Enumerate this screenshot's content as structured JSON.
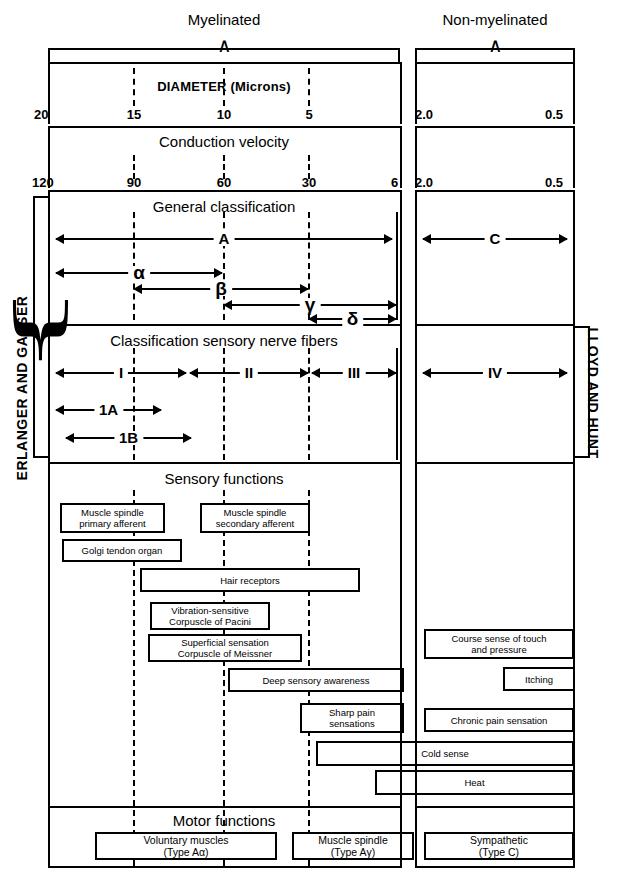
{
  "top_brackets": [
    {
      "label": "Myelinated"
    },
    {
      "label": "Non-myelinated"
    }
  ],
  "axes": {
    "diameter_title": "DIAMETER (Microns)",
    "velocity_title": "Conduction velocity",
    "diameter_ticks_left": [
      "20",
      "15",
      "10",
      "5"
    ],
    "diameter_ticks_right": [
      "2.0",
      "0.5"
    ],
    "velocity_ticks_left": [
      "120",
      "90",
      "60",
      "30",
      "6"
    ],
    "velocity_ticks_right": [
      "2.0",
      "0.5"
    ]
  },
  "side_labels": {
    "left": "ERLANGER AND GASSER",
    "right": "LLOYD AND HUNT"
  },
  "sections": {
    "general": {
      "title": "General classification",
      "spans_left": [
        "A",
        "α",
        "β",
        "γ",
        "δ"
      ],
      "spans_right": [
        "C"
      ]
    },
    "sensory_classification": {
      "title": "Classification sensory nerve fibers",
      "spans_left": [
        "I",
        "II",
        "III",
        "1A",
        "1B"
      ],
      "spans_right": [
        "IV"
      ]
    },
    "sensory_functions": {
      "title": "Sensory functions",
      "boxes_left": [
        "Muscle spindle\nprimary afferent",
        "Muscle spindle\nsecondary afferent",
        "Golgi tendon organ",
        "Hair receptors",
        "Vibration-sensitive\nCorpuscle of Pacini",
        "Superficial sensation\nCorpuscle of Meissner",
        "Deep sensory awareness",
        "Sharp pain\nsensations"
      ],
      "boxes_right": [
        "Course sense of touch\nand pressure",
        "Itching",
        "Chronic pain sensation"
      ],
      "boxes_spanning": [
        "Cold sense",
        "Heat"
      ]
    },
    "motor_functions": {
      "title": "Motor functions",
      "boxes": [
        "Voluntary muscles\n(Type Aα)",
        "Muscle spindle\n(Type Aγ)",
        "Sympathetic\n(Type C)"
      ]
    }
  },
  "colors": {
    "ink": "#000000",
    "paper": "#ffffff"
  }
}
